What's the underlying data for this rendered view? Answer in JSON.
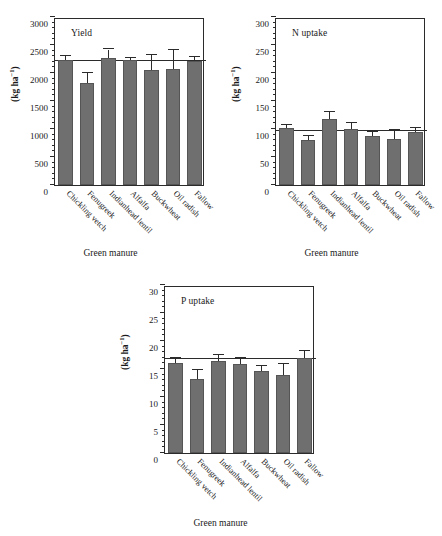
{
  "figure": {
    "background": "#ffffff",
    "bar_color": "#6f6f6f",
    "axis_color": "#2b2b2b"
  },
  "categories": [
    "Chickling vetch",
    "Fenugreek",
    "Indianhead lentil",
    "Alfalfa",
    "Buckwheat",
    "Oil radish",
    "Fallow"
  ],
  "axis": {
    "xlabel": "Green manure",
    "ylabel_text": "(kg ha",
    "ylabel_sup": "−1",
    "ylabel_close": ")"
  },
  "panels": {
    "yield": {
      "title": "Yield",
      "ylim": [
        0,
        3000
      ],
      "yticks": [
        0,
        500,
        1000,
        1500,
        2000,
        2500,
        3000
      ],
      "ytick_labels": [
        "0",
        "500",
        "1000",
        "1500",
        "2000",
        "2500",
        "3000"
      ],
      "minor_tick_step": 100,
      "reference_line": 2220
    },
    "nuptake": {
      "title": "N uptake",
      "ylim": [
        0,
        300
      ],
      "yticks": [
        0,
        50,
        100,
        150,
        200,
        250,
        300
      ],
      "ytick_labels": [
        "0",
        "50",
        "100",
        "150",
        "200",
        "250",
        "300"
      ],
      "minor_tick_step": 10,
      "reference_line": 96
    },
    "puptake": {
      "title": "P uptake",
      "ylim": [
        0,
        30
      ],
      "yticks": [
        0,
        5,
        10,
        15,
        20,
        25,
        30
      ],
      "ytick_labels": [
        "0",
        "5",
        "10",
        "15",
        "20",
        "25",
        "30"
      ],
      "minor_tick_step": 1,
      "reference_line": 16.8
    }
  },
  "chart_data": [
    {
      "type": "bar",
      "title": "Yield",
      "xlabel": "Green manure",
      "ylabel": "(kg ha⁻¹)",
      "ylim": [
        0,
        3000
      ],
      "yticks": [
        0,
        500,
        1000,
        1500,
        2000,
        2500,
        3000
      ],
      "grid": false,
      "legend": "none",
      "reference_line": 2220,
      "categories": [
        "Chickling vetch",
        "Fenugreek",
        "Indianhead lentil",
        "Alfalfa",
        "Buckwheat",
        "Oil radish",
        "Fallow"
      ],
      "values": [
        2240,
        1820,
        2260,
        2240,
        2050,
        2080,
        2220
      ],
      "errors": [
        60,
        180,
        160,
        20,
        270,
        330,
        70
      ]
    },
    {
      "type": "bar",
      "title": "N uptake",
      "xlabel": "Green manure",
      "ylabel": "(kg ha⁻¹)",
      "ylim": [
        0,
        300
      ],
      "yticks": [
        0,
        50,
        100,
        150,
        200,
        250,
        300
      ],
      "grid": false,
      "legend": "none",
      "reference_line": 96,
      "categories": [
        "Chickling vetch",
        "Fenugreek",
        "Indianhead lentil",
        "Alfalfa",
        "Buckwheat",
        "Oil radish",
        "Fallow"
      ],
      "values": [
        102,
        80,
        117,
        100,
        87,
        83,
        95
      ],
      "errors": [
        5,
        8,
        13,
        10,
        8,
        16,
        7
      ]
    },
    {
      "type": "bar",
      "title": "P uptake",
      "xlabel": "Green manure",
      "ylabel": "(kg ha⁻¹)",
      "ylim": [
        0,
        30
      ],
      "yticks": [
        0,
        5,
        10,
        15,
        20,
        25,
        30
      ],
      "grid": false,
      "legend": "none",
      "reference_line": 16.8,
      "categories": [
        "Chickling vetch",
        "Fenugreek",
        "Indianhead lentil",
        "Alfalfa",
        "Buckwheat",
        "Oil radish",
        "Fallow"
      ],
      "values": [
        16.0,
        13.2,
        16.5,
        15.9,
        14.7,
        14.0,
        16.9
      ],
      "errors": [
        1.0,
        1.7,
        1.0,
        1.1,
        0.9,
        1.9,
        1.3
      ]
    }
  ]
}
